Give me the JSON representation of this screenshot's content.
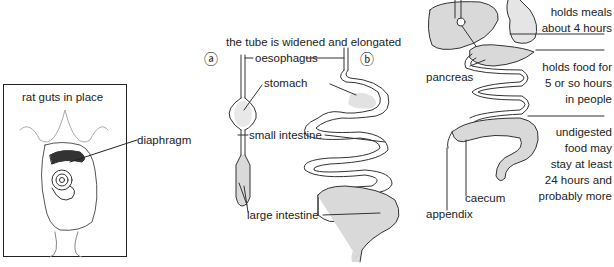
{
  "panel_rat": {
    "title": "rat guts in place",
    "label_diaphragm": "diaphragm"
  },
  "panel_tube": {
    "heading": "the tube is widened and elongated",
    "marker_a": "ⓐ",
    "marker_b": "ⓑ",
    "labels": {
      "oesophagus": "oesophagus",
      "stomach": "stomach",
      "small_intestine": "small intestine",
      "large_intestine": "large intestine"
    }
  },
  "panel_human": {
    "labels": {
      "pancreas": "pancreas",
      "caecum": "caecum",
      "appendix": "appendix"
    },
    "notes": {
      "stomach_line1": "holds meals",
      "stomach_line2": "about 4 hours",
      "small_line1": "holds food for",
      "small_line2": "5 or so hours",
      "small_line3": "in people",
      "large_line1": "undigested",
      "large_line2": "food may",
      "large_line3": "stay at least",
      "large_line4": "24 hours and",
      "large_line5": "probably more"
    }
  },
  "colors": {
    "ink": "#222222",
    "organ_fill": "#d9d9d9",
    "background": "#ffffff"
  }
}
